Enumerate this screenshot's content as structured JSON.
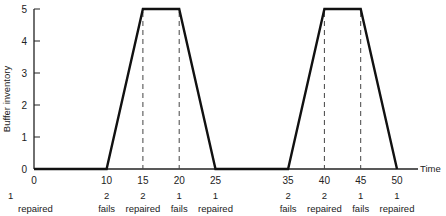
{
  "chart_data": {
    "type": "line",
    "title": "",
    "xlabel": "Time",
    "ylabel": "Buffer inventory",
    "xlim": [
      0,
      50
    ],
    "ylim": [
      0,
      5
    ],
    "grid": false,
    "legend": "none",
    "x_ticks": [
      0,
      10,
      15,
      20,
      25,
      35,
      40,
      45,
      50
    ],
    "y_ticks": [
      0,
      1,
      2,
      3,
      4,
      5
    ],
    "series": [
      {
        "name": "Buffer inventory",
        "x": [
          0,
          10,
          15,
          20,
          25,
          35,
          40,
          45,
          50
        ],
        "y": [
          0,
          0,
          5,
          5,
          0,
          0,
          5,
          5,
          0
        ]
      }
    ],
    "dashed_verticals": [
      15,
      20,
      40,
      45
    ],
    "event_annotations": [
      {
        "x": 0,
        "count": "1",
        "event": "repaired"
      },
      {
        "x": 10,
        "count": "2",
        "event": "fails"
      },
      {
        "x": 15,
        "count": "2",
        "event": "repaired"
      },
      {
        "x": 20,
        "count": "1",
        "event": "fails"
      },
      {
        "x": 25,
        "count": "1",
        "event": "repaired"
      },
      {
        "x": 35,
        "count": "2",
        "event": "fails"
      },
      {
        "x": 40,
        "count": "2",
        "event": "repaired"
      },
      {
        "x": 45,
        "count": "1",
        "event": "fails"
      },
      {
        "x": 50,
        "count": "1",
        "event": "repaired"
      }
    ],
    "colors": {
      "line": "#111111",
      "axis": "#222222",
      "dashed": "#444444"
    }
  }
}
